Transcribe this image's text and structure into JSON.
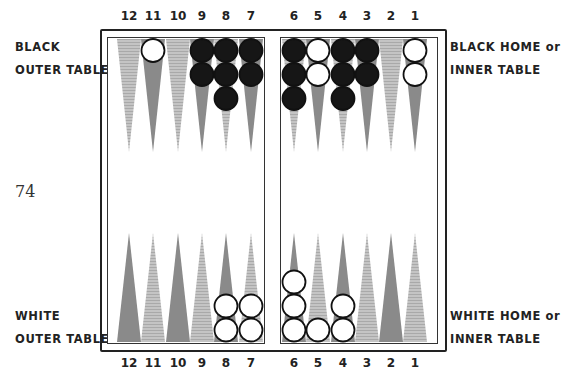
{
  "page_number": "74",
  "labels": {
    "black_outer": [
      "BLACK",
      "OUTER TABLE"
    ],
    "black_home": [
      "BLACK HOME or",
      "INNER TABLE"
    ],
    "white_outer": [
      "WHITE",
      "OUTER TABLE"
    ],
    "white_home": [
      "WHITE HOME or",
      "INNER TABLE"
    ]
  },
  "point_numbers": [
    "12",
    "11",
    "10",
    "9",
    "8",
    "7",
    "6",
    "5",
    "4",
    "3",
    "2",
    "1"
  ],
  "colors": {
    "dark_point": "#8a8a8a",
    "light_point": "#bdbdbd",
    "black_checker": "#161616",
    "white_checker": "#ffffff",
    "frame": "#222222"
  },
  "board": {
    "top_points": [
      {
        "point": "12",
        "shade": "light",
        "black": 0,
        "white": 0
      },
      {
        "point": "11",
        "shade": "dark",
        "black": 0,
        "white": 1
      },
      {
        "point": "10",
        "shade": "light",
        "black": 0,
        "white": 0
      },
      {
        "point": "9",
        "shade": "dark",
        "black": 2,
        "white": 0
      },
      {
        "point": "8",
        "shade": "light",
        "black": 3,
        "white": 0
      },
      {
        "point": "7",
        "shade": "dark",
        "black": 2,
        "white": 0
      },
      {
        "point": "6",
        "shade": "light",
        "black": 3,
        "white": 0
      },
      {
        "point": "5",
        "shade": "dark",
        "black": 0,
        "white": 2
      },
      {
        "point": "4",
        "shade": "light",
        "black": 3,
        "white": 0
      },
      {
        "point": "3",
        "shade": "dark",
        "black": 2,
        "white": 0
      },
      {
        "point": "2",
        "shade": "light",
        "black": 0,
        "white": 0
      },
      {
        "point": "1",
        "shade": "dark",
        "black": 0,
        "white": 2
      }
    ],
    "bottom_points": [
      {
        "point": "12",
        "shade": "dark",
        "black": 0,
        "white": 0
      },
      {
        "point": "11",
        "shade": "light",
        "black": 0,
        "white": 0
      },
      {
        "point": "10",
        "shade": "dark",
        "black": 0,
        "white": 0
      },
      {
        "point": "9",
        "shade": "light",
        "black": 0,
        "white": 0
      },
      {
        "point": "8",
        "shade": "dark",
        "black": 0,
        "white": 2
      },
      {
        "point": "7",
        "shade": "light",
        "black": 0,
        "white": 2
      },
      {
        "point": "6",
        "shade": "dark",
        "black": 0,
        "white": 3
      },
      {
        "point": "5",
        "shade": "light",
        "black": 0,
        "white": 1
      },
      {
        "point": "4",
        "shade": "dark",
        "black": 0,
        "white": 2
      },
      {
        "point": "3",
        "shade": "light",
        "black": 0,
        "white": 0
      },
      {
        "point": "2",
        "shade": "dark",
        "black": 0,
        "white": 0
      },
      {
        "point": "1",
        "shade": "light",
        "black": 0,
        "white": 0
      }
    ]
  }
}
